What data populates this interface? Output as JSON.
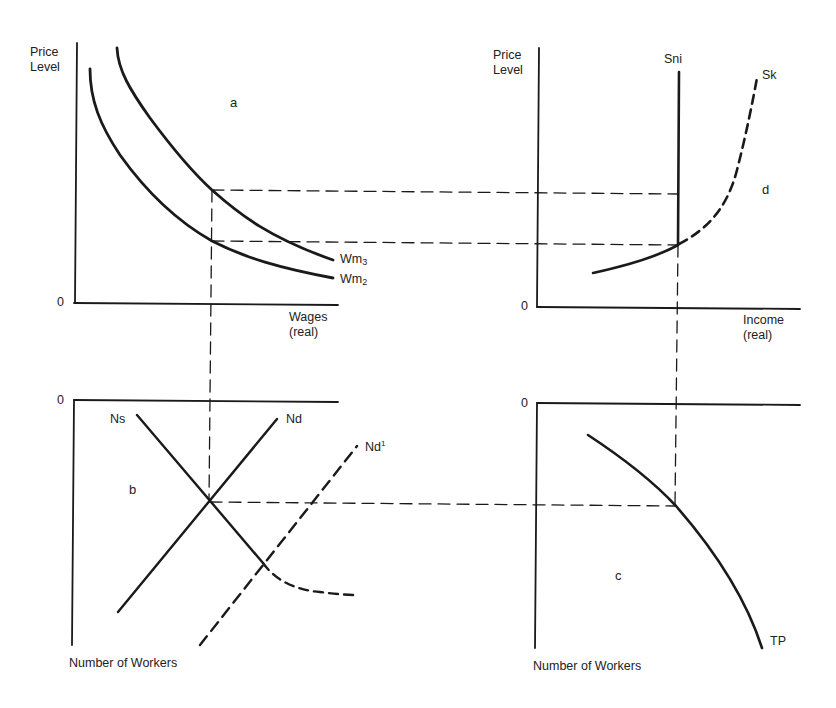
{
  "panels": {
    "a": {
      "letter": "a",
      "y_label_1": "Price",
      "y_label_2": "Level",
      "origin": "0",
      "x_label_1": "Wages",
      "x_label_2": "(real)",
      "curves": [
        {
          "name": "Wm",
          "subscript": "3",
          "style": "solid"
        },
        {
          "name": "Wm",
          "subscript": "2",
          "style": "solid"
        }
      ]
    },
    "d": {
      "letter": "d",
      "y_label_1": "Price",
      "y_label_2": "Level",
      "origin": "0",
      "x_label_1": "Income",
      "x_label_2": "(real)",
      "curves": [
        {
          "name": "Sni",
          "style": "solid"
        },
        {
          "name": "Sk",
          "style": "dashed"
        }
      ]
    },
    "b": {
      "letter": "b",
      "origin": "0",
      "x_label": "Number of Workers",
      "curves": [
        {
          "name": "Ns",
          "style": "solid"
        },
        {
          "name": "Nd",
          "style": "solid"
        },
        {
          "name": "Nd",
          "superscript": "1",
          "style": "dashed"
        }
      ]
    },
    "c": {
      "letter": "c",
      "origin": "0",
      "x_label": "Number of Workers",
      "curves": [
        {
          "name": "TP",
          "style": "solid"
        }
      ]
    }
  },
  "colors": {
    "line": "#1a1a1a",
    "background": "#ffffff"
  }
}
